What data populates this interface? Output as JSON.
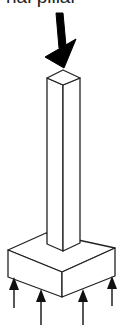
{
  "figure": {
    "caption": "nal pillar"
  },
  "elements": {
    "load_arrow": {
      "direction": "down",
      "color": "#000000"
    },
    "column": {
      "fill": "#ffffff",
      "stroke": "#222222"
    },
    "footing": {
      "fill": "#ffffff",
      "stroke": "#222222"
    },
    "reaction_arrows": {
      "count": 4,
      "direction": "up",
      "color": "#111111"
    }
  }
}
